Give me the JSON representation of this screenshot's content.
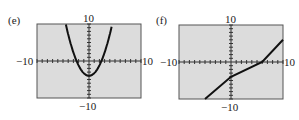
{
  "chart_data": [
    {
      "type": "line",
      "panel_label": "(e)",
      "title": "",
      "xlim": [
        -10,
        10
      ],
      "ylim": [
        -10,
        10
      ],
      "xtick_labels": [
        "-10",
        "10"
      ],
      "ytick_labels": [
        "10",
        "-10"
      ],
      "grid": false,
      "background": "#dcdcdc",
      "curve": "parabola",
      "description": "Upward-opening parabola with vertex near (0, -4)",
      "series": [
        {
          "name": "curve",
          "x": [
            -4.5,
            -3,
            -2,
            -1,
            0,
            1,
            2,
            3,
            4.5
          ],
          "y": [
            10,
            5,
            0,
            -3,
            -4,
            -3,
            0,
            5,
            10
          ]
        }
      ]
    },
    {
      "type": "line",
      "panel_label": "(f)",
      "title": "",
      "xlim": [
        -10,
        10
      ],
      "ylim": [
        -10,
        10
      ],
      "xtick_labels": [
        "-10",
        "10"
      ],
      "ytick_labels": [
        "10",
        "-10"
      ],
      "grid": false,
      "background": "#dcdcdc",
      "curve": "line",
      "description": "Increasing straight line with y-intercept near -4 and x-intercept near 6",
      "series": [
        {
          "name": "line",
          "x": [
            -5,
            0,
            6,
            10
          ],
          "y": [
            -10,
            -4,
            0,
            6
          ]
        }
      ]
    }
  ],
  "labels": {
    "e_panel": "(e)",
    "f_panel": "(f)",
    "e_ymax": "10",
    "e_ymin": "−10",
    "e_xmin": "−10",
    "e_xmax": "10",
    "f_ymax": "10",
    "f_ymin": "−10",
    "f_xmin": "−10",
    "f_xmax": "10"
  }
}
